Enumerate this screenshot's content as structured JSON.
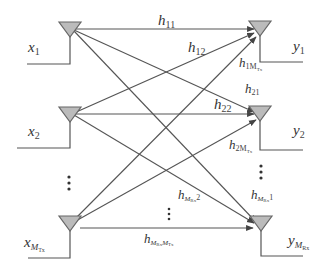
{
  "diagram": {
    "type": "MIMO channel model",
    "transmitters": [
      {
        "id": "tx1",
        "label": "x",
        "sub": "1"
      },
      {
        "id": "tx2",
        "label": "x",
        "sub": "2"
      },
      {
        "id": "txM",
        "label": "x",
        "sub": "M",
        "subsub": "Tx"
      }
    ],
    "receivers": [
      {
        "id": "rx1",
        "label": "y",
        "sub": "1"
      },
      {
        "id": "rx2",
        "label": "y",
        "sub": "2"
      },
      {
        "id": "rxM",
        "label": "y",
        "sub": "M",
        "subsub": "Rx"
      }
    ],
    "channels": [
      {
        "id": "h11",
        "label": "h",
        "sub": "11"
      },
      {
        "id": "h12",
        "label": "h",
        "sub": "12"
      },
      {
        "id": "h1M",
        "label": "h",
        "sub": "1M",
        "subsub": "Tx"
      },
      {
        "id": "h21",
        "label": "h",
        "sub": "21"
      },
      {
        "id": "h22",
        "label": "h",
        "sub": "22"
      },
      {
        "id": "h2M",
        "label": "h",
        "sub": "2M",
        "subsub": "Tx"
      },
      {
        "id": "hM2",
        "label": "h",
        "sub_a": "M",
        "subsub_a": "Rx",
        "sub_b": "2"
      },
      {
        "id": "hM1",
        "label": "h",
        "sub_a": "M",
        "subsub_a": "Rx",
        "sub_b": "1"
      },
      {
        "id": "hMM",
        "label": "h",
        "sub_a": "M",
        "subsub_a": "Rx",
        "sub_b": "M",
        "subsub_b": "Tx"
      }
    ],
    "ellipsis": "⋮",
    "colors": {
      "antenna_fill": "#bbbbbb",
      "line": "#555555",
      "text": "#333333"
    }
  }
}
